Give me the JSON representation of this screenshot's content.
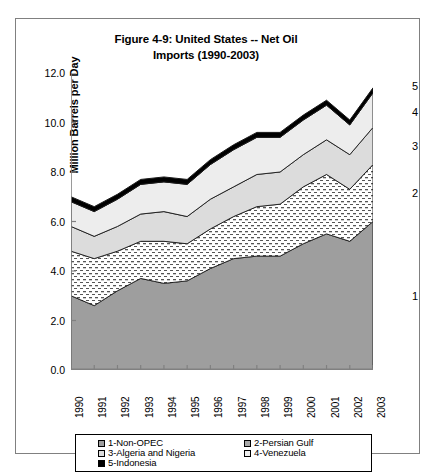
{
  "chart_data": {
    "type": "area",
    "title": "Figure 4-9: United States -- Net Oil Imports (1990-2003)",
    "title_line1": "Figure 4-9: United States -- Net Oil",
    "title_line2": "Imports (1990-2003)",
    "xlabel": "",
    "ylabel": "Million Barrels per Day",
    "ylim": [
      0,
      12
    ],
    "ytick_labels": [
      "0.0",
      "2.0",
      "4.0",
      "6.0",
      "8.0",
      "10.0",
      "12.0"
    ],
    "ytick_values": [
      0,
      2,
      4,
      6,
      8,
      10,
      12
    ],
    "grid": false,
    "stacked": true,
    "legend_position": "bottom",
    "categories": [
      "1990",
      "1991",
      "1992",
      "1993",
      "1994",
      "1995",
      "1996",
      "1997",
      "1998",
      "1999",
      "2000",
      "2001",
      "2002",
      "2003"
    ],
    "x": [
      1990,
      1991,
      1992,
      1993,
      1994,
      1995,
      1996,
      1997,
      1998,
      1999,
      2000,
      2001,
      2002,
      2003
    ],
    "series": [
      {
        "name": "1-Non-OPEC",
        "legend_label": "1-Non-OPEC",
        "end_label": "1",
        "fill": "#9e9e9e",
        "pattern": "solid-gray",
        "values": [
          3.0,
          2.6,
          3.2,
          3.7,
          3.5,
          3.6,
          4.1,
          4.5,
          4.6,
          4.6,
          5.1,
          5.5,
          5.2,
          6.0
        ]
      },
      {
        "name": "2-Persian Gulf",
        "legend_label": "2-Persian Gulf",
        "end_label": "2",
        "fill": "#ffffff",
        "pattern": "dotted",
        "values": [
          1.8,
          1.9,
          1.6,
          1.5,
          1.7,
          1.5,
          1.6,
          1.7,
          2.0,
          2.1,
          2.3,
          2.4,
          2.1,
          2.3
        ]
      },
      {
        "name": "3-Algeria and Nigeria",
        "legend_label": "3-Algeria and Nigeria",
        "end_label": "3",
        "fill": "#dcdcdc",
        "pattern": "light-gray",
        "values": [
          1.0,
          0.9,
          1.0,
          1.1,
          1.2,
          1.1,
          1.2,
          1.2,
          1.3,
          1.3,
          1.3,
          1.4,
          1.4,
          1.5
        ]
      },
      {
        "name": "4-Venezuela",
        "legend_label": "4-Venezuela",
        "end_label": "4",
        "fill": "#ededed",
        "pattern": "very-light",
        "values": [
          1.0,
          1.0,
          1.1,
          1.2,
          1.2,
          1.3,
          1.4,
          1.5,
          1.5,
          1.4,
          1.4,
          1.4,
          1.2,
          1.4
        ]
      },
      {
        "name": "5-Indonesia",
        "legend_label": "5-Indonesia",
        "end_label": "5",
        "fill": "#000000",
        "pattern": "solid-black",
        "values": [
          0.2,
          0.2,
          0.2,
          0.2,
          0.2,
          0.2,
          0.2,
          0.2,
          0.2,
          0.2,
          0.2,
          0.2,
          0.2,
          0.2
        ]
      }
    ],
    "totals": [
      7.0,
      6.6,
      7.1,
      7.7,
      7.8,
      7.7,
      8.5,
      9.1,
      9.6,
      9.6,
      10.3,
      10.9,
      10.1,
      11.4
    ]
  }
}
